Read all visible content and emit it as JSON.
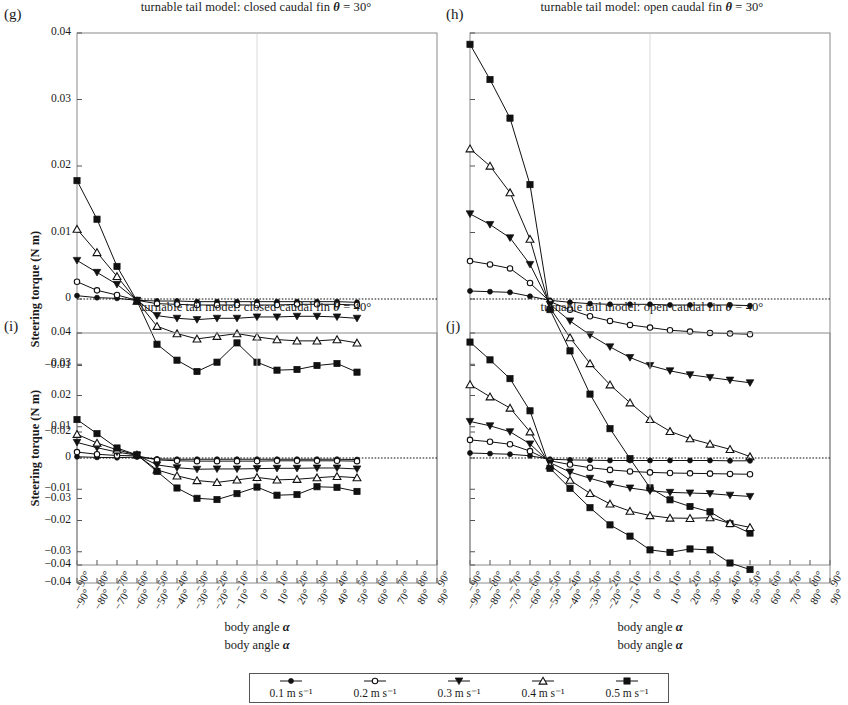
{
  "figure": {
    "xlabel": "body angle α",
    "ylabel": "Steering torque (N m)"
  },
  "legend": {
    "items": [
      {
        "label": "0.1 m s⁻¹",
        "marker": "filled-circle"
      },
      {
        "label": "0.2 m s⁻¹",
        "marker": "open-circle"
      },
      {
        "label": "0.3 m s⁻¹",
        "marker": "filled-down-triangle"
      },
      {
        "label": "0.4 m s⁻¹",
        "marker": "open-up-triangle"
      },
      {
        "label": "0.5 m s⁻¹",
        "marker": "filled-square"
      }
    ]
  },
  "panels": [
    {
      "letter": "(g)",
      "title": "turnable tail model: closed caudal fin θ = 30°"
    },
    {
      "letter": "(h)",
      "title": "turnable tail model: open caudal fin θ = 30°"
    },
    {
      "letter": "(i)",
      "title": "turnable tail model: closed caudal fin θ = 40°"
    },
    {
      "letter": "(j)",
      "title": "turnable tail model: open caudal fin θ = 40°"
    }
  ],
  "chart_data": [
    {
      "panel": "g",
      "type": "line",
      "title": "turnable tail model: closed caudal fin θ = 30°",
      "xlabel": "body angle α",
      "ylabel": "Steering torque (N m)",
      "xlim": [
        -90,
        90
      ],
      "ylim": [
        -0.04,
        0.04
      ],
      "xticks": [
        "-90°",
        "-80°",
        "-70°",
        "-60°",
        "-50°",
        "-40°",
        "-30°",
        "-20°",
        "-10°",
        "0°",
        "10°",
        "20°",
        "30°",
        "40°",
        "50°",
        "60°",
        "70°",
        "80°",
        "90°"
      ],
      "yticks": [
        0.04,
        0.03,
        0.02,
        0.01,
        0,
        -0.01,
        -0.02,
        -0.03,
        -0.04
      ],
      "grid": false,
      "zero_line": true,
      "legend_position": "bottom",
      "x": [
        -90,
        -80,
        -70,
        -60,
        -50,
        -40,
        -30,
        -20,
        -10,
        0,
        10,
        20,
        30,
        40,
        50
      ],
      "series": [
        {
          "name": "0.1 m s⁻¹",
          "marker": "filled-circle",
          "values": [
            0.0005,
            0.0002,
            0.0001,
            -0.0002,
            -0.0003,
            -0.0003,
            -0.0004,
            -0.0004,
            -0.0004,
            -0.0004,
            -0.0004,
            -0.0004,
            -0.0004,
            -0.0004,
            -0.0005
          ]
        },
        {
          "name": "0.2 m s⁻¹",
          "marker": "open-circle",
          "values": [
            0.0026,
            0.0013,
            0.0006,
            -0.0002,
            -0.0007,
            -0.0008,
            -0.0009,
            -0.0009,
            -0.0009,
            -0.0009,
            -0.0009,
            -0.0008,
            -0.0008,
            -0.0008,
            -0.0009
          ]
        },
        {
          "name": "0.3 m s⁻¹",
          "marker": "filled-down-triangle",
          "values": [
            0.0058,
            0.004,
            0.0022,
            -0.0002,
            -0.0025,
            -0.0029,
            -0.0031,
            -0.0029,
            -0.0029,
            -0.0027,
            -0.0027,
            -0.0026,
            -0.0026,
            -0.0027,
            -0.0029
          ]
        },
        {
          "name": "0.4 m s⁻¹",
          "marker": "open-up-triangle",
          "values": [
            0.0105,
            0.007,
            0.0034,
            -0.0003,
            -0.0041,
            -0.0052,
            -0.006,
            -0.0056,
            -0.0052,
            -0.0057,
            -0.0061,
            -0.0063,
            -0.0063,
            -0.0061,
            -0.0066
          ]
        },
        {
          "name": "0.5 m s⁻¹",
          "marker": "filled-square",
          "values": [
            0.0178,
            0.012,
            0.0049,
            -0.0003,
            -0.0068,
            -0.0092,
            -0.0109,
            -0.0095,
            -0.0066,
            -0.0095,
            -0.0107,
            -0.0106,
            -0.01,
            -0.0097,
            -0.011
          ]
        }
      ]
    },
    {
      "panel": "h",
      "type": "line",
      "title": "turnable tail model: open caudal fin θ = 30°",
      "xlabel": "body angle α",
      "ylabel": "Steering torque (N m)",
      "xlim": [
        -90,
        90
      ],
      "ylim": [
        -0.04,
        0.04
      ],
      "xticks": [
        "-90°",
        "-80°",
        "-70°",
        "-60°",
        "-50°",
        "-40°",
        "-30°",
        "-20°",
        "-10°",
        "0°",
        "10°",
        "20°",
        "30°",
        "40°",
        "50°",
        "60°",
        "70°",
        "80°",
        "90°"
      ],
      "yticks": [
        0.04,
        0.03,
        0.02,
        0.01,
        0,
        -0.01,
        -0.02,
        -0.03,
        -0.04
      ],
      "grid": false,
      "zero_line": true,
      "legend_position": "bottom",
      "x": [
        -90,
        -80,
        -70,
        -60,
        -50,
        -40,
        -30,
        -20,
        -10,
        0,
        10,
        20,
        30,
        40,
        50
      ],
      "series": [
        {
          "name": "0.1 m s⁻¹",
          "marker": "filled-circle",
          "values": [
            0.0012,
            0.0011,
            0.001,
            0.0004,
            -0.0002,
            -0.0005,
            -0.0007,
            -0.0008,
            -0.0008,
            -0.0008,
            -0.0009,
            -0.0009,
            -0.0009,
            -0.0009,
            -0.001
          ]
        },
        {
          "name": "0.2 m s⁻¹",
          "marker": "open-circle",
          "values": [
            0.0057,
            0.0052,
            0.0046,
            0.0024,
            -0.0004,
            -0.0016,
            -0.0026,
            -0.0033,
            -0.0039,
            -0.0043,
            -0.0047,
            -0.0049,
            -0.0051,
            -0.0052,
            -0.0053
          ]
        },
        {
          "name": "0.3 m s⁻¹",
          "marker": "filled-down-triangle",
          "values": [
            0.0128,
            0.0112,
            0.0092,
            0.0052,
            -0.0008,
            -0.0033,
            -0.0054,
            -0.0072,
            -0.0088,
            -0.01,
            -0.0108,
            -0.0114,
            -0.0118,
            -0.0122,
            -0.0126
          ]
        },
        {
          "name": "0.4 m s⁻¹",
          "marker": "open-up-triangle",
          "values": [
            0.0226,
            0.02,
            0.016,
            0.009,
            -0.0013,
            -0.0058,
            -0.0097,
            -0.0129,
            -0.0156,
            -0.0181,
            -0.0199,
            -0.021,
            -0.0218,
            -0.0226,
            -0.0237
          ]
        },
        {
          "name": "0.5 m s⁻¹",
          "marker": "filled-square",
          "values": [
            0.0383,
            0.033,
            0.0272,
            0.0172,
            -0.0016,
            -0.0078,
            -0.0143,
            -0.0195,
            -0.024,
            -0.0284,
            -0.0302,
            -0.0312,
            -0.032,
            -0.0338,
            -0.0352
          ]
        }
      ]
    },
    {
      "panel": "i",
      "type": "line",
      "title": "turnable tail model: closed caudal fin θ = 40°",
      "xlabel": "body angle α",
      "ylabel": "Steering torque (N m)",
      "xlim": [
        -90,
        90
      ],
      "ylim": [
        -0.04,
        0.04
      ],
      "xticks": [
        "-90°",
        "-80°",
        "-70°",
        "-60°",
        "-50°",
        "-40°",
        "-30°",
        "-20°",
        "-10°",
        "0°",
        "10°",
        "20°",
        "30°",
        "40°",
        "50°",
        "60°",
        "70°",
        "80°",
        "90°"
      ],
      "yticks": [
        0.04,
        0.03,
        0.02,
        0.01,
        0,
        -0.01,
        -0.02,
        -0.03,
        -0.04
      ],
      "grid": false,
      "zero_line": true,
      "legend_position": "bottom",
      "x": [
        -90,
        -80,
        -70,
        -60,
        -50,
        -40,
        -30,
        -20,
        -10,
        0,
        10,
        20,
        30,
        40,
        50
      ],
      "values_note": "",
      "series": [
        {
          "name": "0.1 m s⁻¹",
          "marker": "filled-circle",
          "values": [
            0.0004,
            0.0002,
            0.0001,
            0.0003,
            -0.0003,
            -0.0004,
            -0.0004,
            -0.0004,
            -0.0004,
            -0.0004,
            -0.0004,
            -0.0004,
            -0.0004,
            -0.0004,
            -0.0005
          ]
        },
        {
          "name": "0.2 m s⁻¹",
          "marker": "open-circle",
          "values": [
            0.0019,
            0.0012,
            0.0008,
            0.0007,
            -0.0006,
            -0.0009,
            -0.001,
            -0.001,
            -0.001,
            -0.001,
            -0.0009,
            -0.0009,
            -0.0009,
            -0.0009,
            -0.001
          ]
        },
        {
          "name": "0.3 m s⁻¹",
          "marker": "filled-down-triangle",
          "values": [
            0.005,
            0.0033,
            0.0019,
            0.0009,
            -0.0022,
            -0.0031,
            -0.0036,
            -0.0035,
            -0.0035,
            -0.0034,
            -0.0033,
            -0.0033,
            -0.0032,
            -0.0032,
            -0.0035
          ]
        },
        {
          "name": "0.4 m s⁻¹",
          "marker": "open-up-triangle",
          "values": [
            0.0076,
            0.0048,
            0.0026,
            0.001,
            -0.0038,
            -0.0057,
            -0.0072,
            -0.0078,
            -0.007,
            -0.0062,
            -0.007,
            -0.0068,
            -0.0063,
            -0.0059,
            -0.0063
          ]
        },
        {
          "name": "0.5 m s⁻¹",
          "marker": "filled-square",
          "values": [
            0.0123,
            0.0078,
            0.0032,
            0.001,
            -0.0043,
            -0.0096,
            -0.0129,
            -0.0133,
            -0.0114,
            -0.0093,
            -0.0119,
            -0.0117,
            -0.0092,
            -0.0094,
            -0.0107
          ]
        }
      ]
    },
    {
      "panel": "j",
      "type": "line",
      "title": "turnable tail model: open caudal fin θ = 40°",
      "xlabel": "body angle α",
      "ylabel": "Steering torque (N m)",
      "xlim": [
        -90,
        90
      ],
      "ylim": [
        -0.04,
        0.04
      ],
      "xticks": [
        "-90°",
        "-80°",
        "-70°",
        "-60°",
        "-50°",
        "-40°",
        "-30°",
        "-20°",
        "-10°",
        "0°",
        "10°",
        "20°",
        "30°",
        "40°",
        "50°",
        "60°",
        "70°",
        "80°",
        "90°"
      ],
      "yticks": [
        0.04,
        0.03,
        0.02,
        0.01,
        0,
        -0.01,
        -0.02,
        -0.03,
        -0.04
      ],
      "grid": false,
      "zero_line": true,
      "legend_position": "bottom",
      "x": [
        -90,
        -80,
        -70,
        -60,
        -50,
        -40,
        -30,
        -20,
        -10,
        0,
        10,
        20,
        30,
        40,
        50
      ],
      "series": [
        {
          "name": "0.1 m s⁻¹",
          "marker": "filled-circle",
          "values": [
            0.0016,
            0.0014,
            0.0012,
            0.0007,
            -0.0004,
            -0.0006,
            -0.0007,
            -0.0008,
            -0.0008,
            -0.0008,
            -0.0008,
            -0.0008,
            -0.0008,
            -0.0009,
            -0.0009
          ]
        },
        {
          "name": "0.2 m s⁻¹",
          "marker": "open-circle",
          "values": [
            0.0058,
            0.0052,
            0.0044,
            0.0022,
            -0.0009,
            -0.0021,
            -0.0031,
            -0.0038,
            -0.0043,
            -0.0046,
            -0.0048,
            -0.0049,
            -0.005,
            -0.0051,
            -0.0052
          ]
        },
        {
          "name": "0.3 m s⁻¹",
          "marker": "filled-down-triangle",
          "values": [
            0.0117,
            0.0103,
            0.0084,
            0.0045,
            -0.0015,
            -0.0045,
            -0.0065,
            -0.0083,
            -0.0096,
            -0.0105,
            -0.011,
            -0.0112,
            -0.0114,
            -0.0119,
            -0.0123
          ]
        },
        {
          "name": "0.4 m s⁻¹",
          "marker": "open-up-triangle",
          "values": [
            0.0235,
            0.0196,
            0.016,
            0.0084,
            -0.0024,
            -0.0071,
            -0.0113,
            -0.0147,
            -0.017,
            -0.0184,
            -0.0192,
            -0.0193,
            -0.0191,
            -0.0209,
            -0.0222
          ]
        },
        {
          "name": "0.5 m s⁻¹",
          "marker": "filled-square",
          "values": [
            0.0371,
            0.0314,
            0.0254,
            0.0151,
            -0.0033,
            -0.0097,
            -0.0159,
            -0.0214,
            -0.025,
            -0.0294,
            -0.0302,
            -0.0291,
            -0.0294,
            -0.0336,
            -0.0357
          ]
        }
      ]
    }
  ]
}
